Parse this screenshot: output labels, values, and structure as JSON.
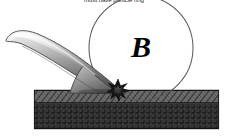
{
  "figure": {
    "title_text": "must have particle ring",
    "callout_label": "B",
    "background_color": "#ffffff",
    "elements": {
      "cantilever_name": "afm-cantilever-tip",
      "cantilever_fill_light": "#e8e8e8",
      "cantilever_fill_mid": "#9a9a9a",
      "cantilever_fill_dark": "#4f4f4f",
      "cantilever_outline": "#3a3a3a",
      "substrate_hatch_layer_name": "substrate-hatched-layer",
      "substrate_hatch_fill": "#6e6e6e",
      "substrate_hatch_line": "#1c1c1c",
      "substrate_particle_layer_name": "substrate-particle-layer",
      "substrate_particle_fill": "#3d3d3d",
      "substrate_particle_grain": "#202020",
      "circle_stroke": "#555555",
      "burst_fill": "#141414",
      "burst_name": "contact-burst-star"
    },
    "geometry": {
      "circle_center_x": 141,
      "circle_center_y": 48,
      "circle_radius": 52,
      "substrate_left": 34,
      "substrate_right": 219,
      "substrate_top": 90,
      "hatch_bottom": 103,
      "particle_bottom": 129,
      "contact_x": 118,
      "contact_y": 91
    },
    "particle_grid": {
      "columns": 33,
      "rows": 5,
      "cell_width": 5.6,
      "cell_height": 5.2
    },
    "hatch_lines": {
      "count": 40,
      "angle_deg": 38
    },
    "burst_spikes": 11
  }
}
